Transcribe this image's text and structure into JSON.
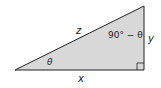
{
  "diagram": {
    "type": "right-triangle",
    "fill": "#d8d8d8",
    "stroke": "#222222",
    "labels": {
      "hypotenuse": "z",
      "opposite": "y",
      "adjacent": "x",
      "angle_left": "θ",
      "angle_top": "90° − θ"
    },
    "right_angle_marker": true
  }
}
